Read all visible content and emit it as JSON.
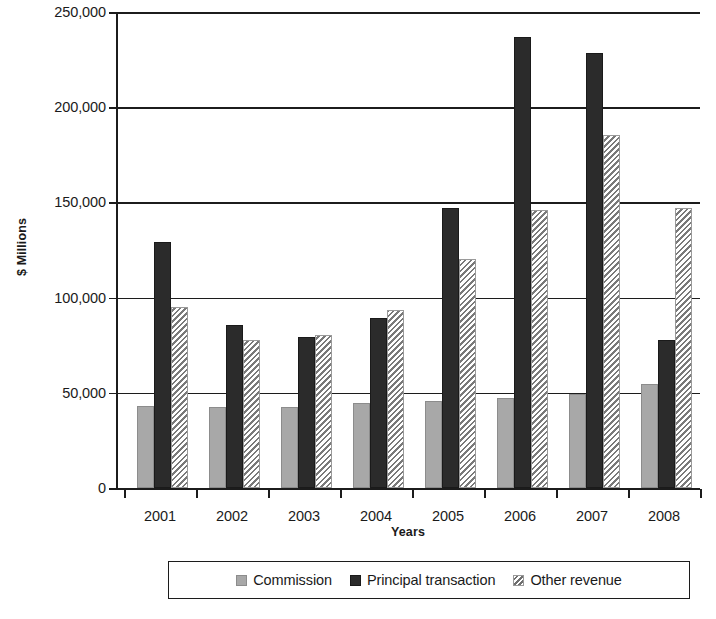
{
  "chart_data": {
    "type": "bar",
    "title": "",
    "subtitle": "",
    "xlabel": "Years",
    "ylabel": "$ Millions",
    "categories": [
      "2001",
      "2002",
      "2003",
      "2004",
      "2005",
      "2006",
      "2007",
      "2008"
    ],
    "ylim": [
      0,
      250000
    ],
    "yticks": [
      0,
      50000,
      100000,
      150000,
      200000,
      250000
    ],
    "ytick_labels": [
      "0",
      "50,000",
      "100,000",
      "150,000",
      "200,000",
      "250,000"
    ],
    "grid": true,
    "grid_axis": "y",
    "legend_position": "bottom",
    "bar_group_mode": "grouped",
    "series": [
      {
        "name": "Commission",
        "color": "#a8a8a8",
        "fill": "solid-gray",
        "values": [
          43000,
          42500,
          42500,
          44500,
          45500,
          47500,
          49500,
          54500
        ]
      },
      {
        "name": "Principal transaction",
        "color": "#2b2b2b",
        "fill": "solid-black",
        "values": [
          129000,
          85500,
          79500,
          89500,
          147000,
          237000,
          228500,
          78000
        ]
      },
      {
        "name": "Other revenue",
        "color": "#7a7a7a",
        "fill": "diagonal-hatch",
        "values": [
          95000,
          78000,
          80500,
          93500,
          120500,
          146000,
          185500,
          147000
        ]
      }
    ]
  },
  "axes": {
    "y_title": "$ Millions",
    "x_title": "Years",
    "y_tick_labels": [
      "250,000",
      "200,000",
      "150,000",
      "100,000",
      "50,000",
      "0"
    ],
    "x_tick_labels": [
      "2001",
      "2002",
      "2003",
      "2004",
      "2005",
      "2006",
      "2007",
      "2008"
    ]
  },
  "legend": {
    "items": [
      {
        "label": "Commission",
        "swatch": "legend-swatch-commission"
      },
      {
        "label": "Principal transaction",
        "swatch": "legend-swatch-principal"
      },
      {
        "label": "Other revenue",
        "swatch": "legend-swatch-other-revenue"
      }
    ]
  },
  "colors": {
    "commission": "#a8a8a8",
    "principal_transaction": "#2b2b2b",
    "other_revenue": "#7a7a7a",
    "axis": "#1c1c1c",
    "background": "#ffffff"
  }
}
